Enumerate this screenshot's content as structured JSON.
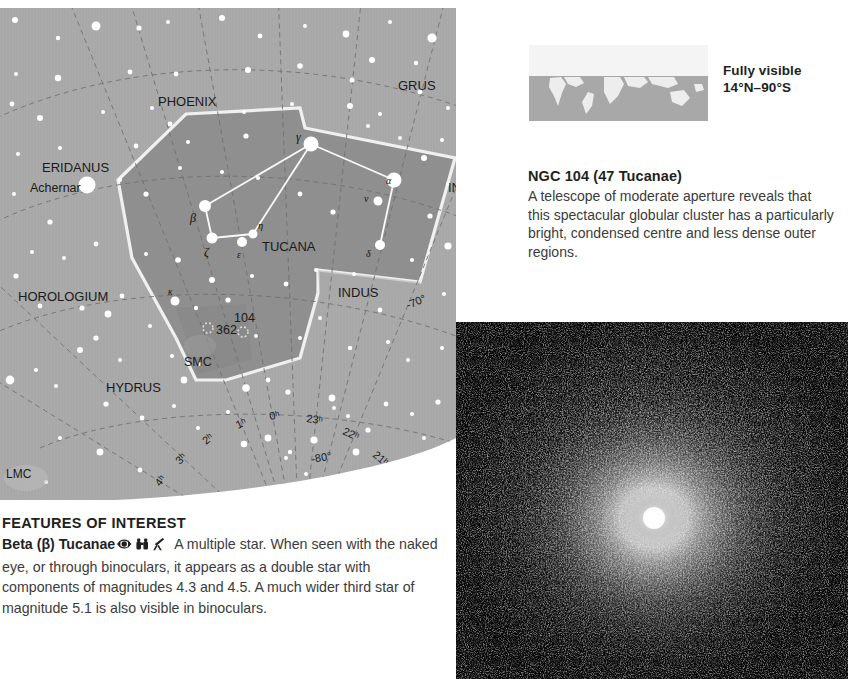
{
  "star_chart": {
    "name": "tucana-star-chart",
    "constellation_labels": [
      {
        "label": "PHOENIX",
        "x": 188,
        "y": 93
      },
      {
        "label": "GRUS",
        "x": 399,
        "y": 77
      },
      {
        "label": "ERIDANUS",
        "x": 72,
        "y": 160
      },
      {
        "label": "Achernar",
        "x": 60,
        "y": 180
      },
      {
        "label": "INDUS",
        "x": 472,
        "y": 180
      },
      {
        "label": "INDUS",
        "x": 370,
        "y": 284
      },
      {
        "label": "TUCANA",
        "x": 290,
        "y": 239
      },
      {
        "label": "HOROLOGIUM",
        "x": 62,
        "y": 289
      },
      {
        "label": "HYDRUS",
        "x": 130,
        "y": 380
      },
      {
        "label": "OCTANS",
        "x": 310,
        "y": 484
      },
      {
        "label": "LMC",
        "x": 14,
        "y": 466
      },
      {
        "label": "SMC",
        "x": 200,
        "y": 352
      },
      {
        "label": "362",
        "x": 222,
        "y": 322
      },
      {
        "label": "104",
        "x": 248,
        "y": 312
      }
    ],
    "greek_star_labels": [
      {
        "label": "γ",
        "x": 299,
        "y": 130
      },
      {
        "label": "α",
        "x": 393,
        "y": 182
      },
      {
        "label": "ν",
        "x": 367,
        "y": 196
      },
      {
        "label": "δ",
        "x": 368,
        "y": 240
      },
      {
        "label": "β",
        "x": 196,
        "y": 211
      },
      {
        "label": "ζ",
        "x": 216,
        "y": 240
      },
      {
        "label": "ε",
        "x": 241,
        "y": 244
      },
      {
        "label": "η",
        "x": 261,
        "y": 221
      },
      {
        "label": "κ",
        "x": 172,
        "y": 284
      }
    ],
    "ra_labels": [
      "4ʰ",
      "3ʰ",
      "2ʰ",
      "1ʰ",
      "0ʰ",
      "23ʰ",
      "22ʰ",
      "21ʰ",
      "20ʰ"
    ],
    "dec_labels": [
      "-60°",
      "-70°",
      "-80°"
    ],
    "grid_labels": [
      {
        "label": "-60°",
        "x": 462,
        "y": 214,
        "rot": -22
      },
      {
        "label": "-70°",
        "x": 412,
        "y": 301,
        "rot": -22
      },
      {
        "label": "-80°",
        "x": 318,
        "y": 455,
        "rot": -12
      },
      {
        "label": "4ʰ",
        "x": 163,
        "y": 477,
        "rot": -52
      },
      {
        "label": "3ʰ",
        "x": 182,
        "y": 455,
        "rot": -46
      },
      {
        "label": "2ʰ",
        "x": 209,
        "y": 436,
        "rot": -38
      },
      {
        "label": "1ʰ",
        "x": 240,
        "y": 420,
        "rot": -26
      },
      {
        "label": "0ʰ",
        "x": 272,
        "y": 412,
        "rot": -12
      },
      {
        "label": "23ʰ",
        "x": 312,
        "y": 414,
        "rot": 8
      },
      {
        "label": "22ʰ",
        "x": 348,
        "y": 425,
        "rot": 24
      },
      {
        "label": "21ʰ",
        "x": 378,
        "y": 448,
        "rot": 40
      },
      {
        "label": "20ʰ",
        "x": 398,
        "y": 470,
        "rot": 52
      }
    ],
    "colors": {
      "sky": "#a8a8a8",
      "tucana_fill": "#8f8f8f",
      "boundary": "#f2f2f2",
      "grid": "#7a7a7a",
      "star": "#ffffff",
      "label_text": "#1a1a1a"
    }
  },
  "visibility": {
    "map_name": "world-visibility-map",
    "caption_line1": "Fully visible",
    "caption_line2": "14°N–90°S",
    "visible_band_color": "#a8a8a8",
    "hidden_band_color": "#f2f2f2"
  },
  "ngc": {
    "title": "NGC 104 (47 Tucanae)",
    "body": "A telescope of moderate aperture reveals that this spectacular globular cluster has a particularly bright, condensed centre and less dense outer regions."
  },
  "cluster_photo": {
    "name": "globular-cluster-photograph",
    "alt": "Photograph of globular cluster NGC 104 (47 Tucanae) with bright condensed core"
  },
  "features": {
    "heading": "FEATURES OF INTEREST",
    "entry_name": "Beta (β) Tucanae",
    "icons": [
      "naked-eye-icon",
      "binoculars-icon",
      "telescope-icon"
    ],
    "text": "A multiple star. When seen with the naked eye, or through binoculars, it appears as a double star with components of magnitudes 4.3 and 4.5. A much wider third star of magnitude 5.1 is also visible in binoculars."
  }
}
